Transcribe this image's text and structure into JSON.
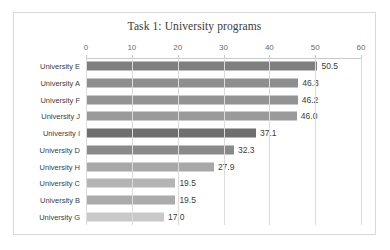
{
  "chart_data": {
    "type": "bar",
    "orientation": "horizontal",
    "title": "Task 1: University programs",
    "xlabel": "",
    "ylabel": "",
    "categories": [
      "University E",
      "University A",
      "University F",
      "University J",
      "University I",
      "University D",
      "University H",
      "University C",
      "University B",
      "University G"
    ],
    "values": [
      50.5,
      46.3,
      46.2,
      46.0,
      37.1,
      32.3,
      27.9,
      19.5,
      19.5,
      17.0
    ],
    "value_labels": [
      "50.5",
      "46.3",
      "46.2",
      "46.0",
      "37.1",
      "32.3",
      "27.9",
      "19.5",
      "19.5",
      "17.0"
    ],
    "bar_colors": [
      "#7f7f7f",
      "#8e8e8e",
      "#939393",
      "#9a9a9a",
      "#6e6e6e",
      "#8a8a8a",
      "#a8a8a8",
      "#b4b4b4",
      "#ababab",
      "#c9c9c9"
    ],
    "xlim": [
      0,
      60
    ],
    "xticks": [
      0,
      10,
      20,
      30,
      40,
      50,
      60
    ],
    "xtick_labels": [
      "0",
      "10",
      "20",
      "30",
      "40",
      "50",
      "60"
    ],
    "grid": true,
    "grid_axis": "x",
    "legend": false,
    "axis_position": "top",
    "gridline_color": "#dcdcdc",
    "axis_line_color": "#c8c8c8",
    "title_color": "#3a3a3a",
    "label_color": "#3c3c3c",
    "tick_color": "#6b6b6b",
    "frame_border_color": "#d9d9d9",
    "background": "#ffffff"
  }
}
